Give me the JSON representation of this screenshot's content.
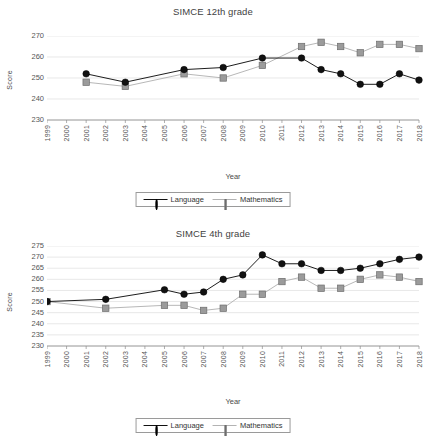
{
  "figure": {
    "axis_label_y": "Score",
    "axis_label_x": "Year",
    "legend": {
      "language_label": "Language",
      "mathematics_label": "Mathematics"
    },
    "colors": {
      "language": "#111111",
      "mathematics": "#9b9b9b",
      "mathematics_line": "#b3b3b3",
      "grid": "#d8d8d8",
      "axis": "#8c8c8c",
      "text": "#4a4a4a"
    }
  },
  "chart_data": [
    {
      "type": "line",
      "title": "SIMCE 12th grade",
      "xlabel": "Year",
      "ylabel": "Score",
      "grid": true,
      "legend_position": "bottom",
      "ylim": [
        230,
        270
      ],
      "yticks": [
        230,
        240,
        250,
        260,
        270
      ],
      "categories": [
        1999,
        2000,
        2001,
        2002,
        2003,
        2004,
        2005,
        2006,
        2007,
        2008,
        2009,
        2010,
        2011,
        2012,
        2013,
        2014,
        2015,
        2016,
        2017,
        2018
      ],
      "xticklabels": [
        "1999",
        "2000",
        "2001",
        "2002",
        "2003",
        "2004",
        "2005",
        "2006",
        "2007",
        "2008",
        "2009",
        "2010",
        "2011",
        "2012",
        "2013",
        "2014",
        "2015",
        "2016",
        "2017",
        "2018"
      ],
      "series": [
        {
          "name": "Language",
          "marker": "circle",
          "values": [
            null,
            null,
            252,
            null,
            248,
            null,
            null,
            254,
            null,
            255,
            null,
            259.5,
            null,
            259.5,
            254,
            252,
            247,
            247,
            252,
            249
          ]
        },
        {
          "name": "Mathematics",
          "marker": "square",
          "values": [
            null,
            null,
            248,
            null,
            246,
            null,
            null,
            252,
            null,
            250,
            null,
            256,
            null,
            265,
            267,
            265,
            262,
            266,
            266,
            264
          ]
        }
      ]
    },
    {
      "type": "line",
      "title": "SIMCE 4th grade",
      "xlabel": "Year",
      "ylabel": "Score",
      "grid": true,
      "legend_position": "bottom",
      "ylim": [
        230,
        275
      ],
      "yticks": [
        230,
        235,
        240,
        245,
        250,
        255,
        260,
        265,
        270,
        275
      ],
      "categories": [
        1999,
        2000,
        2001,
        2002,
        2003,
        2004,
        2005,
        2006,
        2007,
        2008,
        2009,
        2010,
        2011,
        2012,
        2013,
        2014,
        2015,
        2016,
        2017,
        2018
      ],
      "xticklabels": [
        "1999",
        "2000",
        "2001",
        "2002",
        "2003",
        "2004",
        "2005",
        "2006",
        "2007",
        "2008",
        "2009",
        "2010",
        "2011",
        "2012",
        "2013",
        "2014",
        "2015",
        "2016",
        "2017",
        "2018"
      ],
      "series": [
        {
          "name": "Language",
          "marker": "circle",
          "values": [
            250,
            null,
            null,
            251,
            null,
            null,
            255.3,
            253.3,
            254.3,
            260,
            262,
            271,
            267,
            267,
            264,
            264,
            265,
            267,
            269,
            270
          ]
        },
        {
          "name": "Mathematics",
          "marker": "square",
          "values": [
            250,
            null,
            null,
            247,
            null,
            null,
            248.3,
            248.3,
            246,
            247,
            253.3,
            253.3,
            259,
            261,
            256,
            256,
            260,
            262,
            261,
            259
          ]
        }
      ]
    }
  ]
}
